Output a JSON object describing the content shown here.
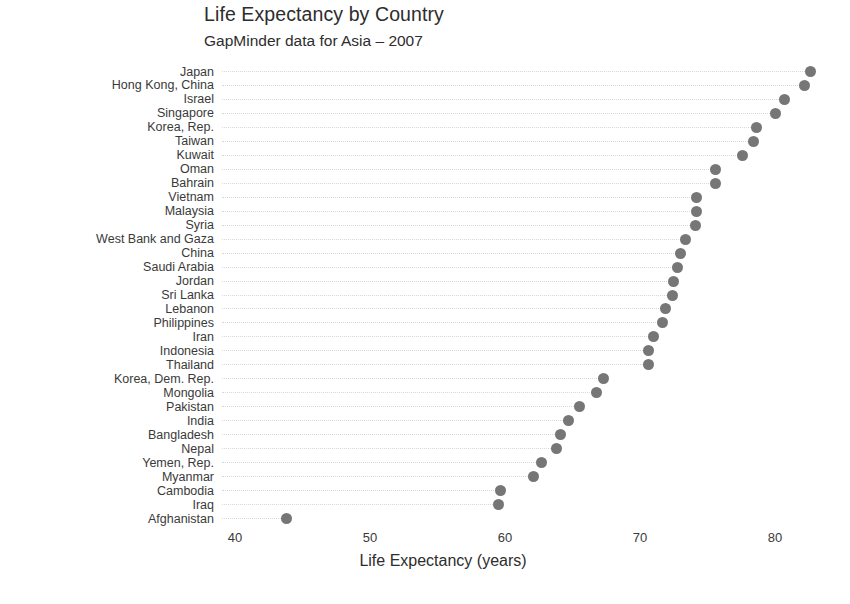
{
  "chart_data": {
    "type": "scatter",
    "title": "Life Expectancy by Country",
    "subtitle": "GapMinder data for Asia – 2007",
    "xlabel": "Life Expectancy (years)",
    "ylabel": "",
    "xlim": [
      38.5,
      84.5
    ],
    "xticks": [
      40,
      50,
      60,
      70,
      80
    ],
    "xtick_labels": [
      "40",
      "50",
      "60",
      "70",
      "80"
    ],
    "grid": false,
    "leader_lines": true,
    "legend": "none",
    "sort": "descending by value",
    "marker_color": "#767676",
    "leader_color": "#d8d8d8",
    "categories": [
      "Japan",
      "Hong Kong, China",
      "Israel",
      "Singapore",
      "Korea, Rep.",
      "Taiwan",
      "Kuwait",
      "Oman",
      "Bahrain",
      "Vietnam",
      "Malaysia",
      "Syria",
      "West Bank and Gaza",
      "China",
      "Saudi Arabia",
      "Jordan",
      "Sri Lanka",
      "Lebanon",
      "Philippines",
      "Iran",
      "Indonesia",
      "Thailand",
      "Korea, Dem. Rep.",
      "Mongolia",
      "Pakistan",
      "India",
      "Bangladesh",
      "Nepal",
      "Yemen, Rep.",
      "Myanmar",
      "Cambodia",
      "Iraq",
      "Afghanistan"
    ],
    "values": [
      82.6,
      82.2,
      80.7,
      80.0,
      78.6,
      78.4,
      77.6,
      75.6,
      75.6,
      74.2,
      74.2,
      74.1,
      73.4,
      73.0,
      72.8,
      72.5,
      72.4,
      71.9,
      71.7,
      71.0,
      70.6,
      70.6,
      67.3,
      66.8,
      65.5,
      64.7,
      64.1,
      63.8,
      62.7,
      62.1,
      59.7,
      59.5,
      43.8
    ]
  }
}
